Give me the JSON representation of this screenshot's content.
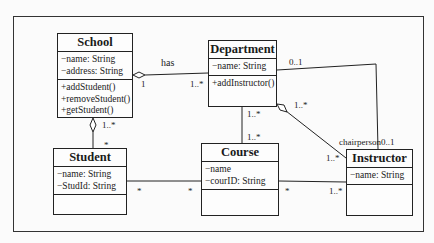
{
  "diagram": {
    "type": "UML class diagram",
    "classes": [
      {
        "name": "School",
        "attributes": [
          "−name: String",
          "−address: String"
        ],
        "operations": [
          "+addStudent()",
          "+removeStudent()",
          "+getStudent()"
        ]
      },
      {
        "name": "Department",
        "attributes": [
          "−name: String"
        ],
        "operations": [
          "+addInstructor()"
        ]
      },
      {
        "name": "Student",
        "attributes": [
          "−name: String",
          "−StudId: String"
        ],
        "operations": []
      },
      {
        "name": "Course",
        "attributes": [
          "−name",
          "−courID: String"
        ],
        "operations": []
      },
      {
        "name": "Instructor",
        "attributes": [
          "−name: String"
        ],
        "operations": []
      }
    ],
    "associations": [
      {
        "from": "School",
        "to": "Department",
        "label": "has",
        "from_mult": "1",
        "to_mult": "1..*",
        "kind": "aggregation"
      },
      {
        "from": "School",
        "to": "Student",
        "from_mult": "1..*",
        "to_mult": "*",
        "kind": "aggregation"
      },
      {
        "from": "Department",
        "to": "Course",
        "from_mult": "1..*",
        "to_mult": "1..*",
        "kind": "association"
      },
      {
        "from": "Department",
        "to": "Instructor",
        "from_mult": "1..*",
        "to_mult": "1..*",
        "kind": "aggregation"
      },
      {
        "from": "Department",
        "to": "Instructor",
        "from_mult": "0..1",
        "to_mult": "chairperson0..1",
        "kind": "association"
      },
      {
        "from": "Student",
        "to": "Course",
        "from_mult": "*",
        "to_mult": "*",
        "kind": "association"
      },
      {
        "from": "Course",
        "to": "Instructor",
        "from_mult": "*",
        "to_mult": "1..*",
        "kind": "association"
      }
    ]
  },
  "labels": {
    "has": "has",
    "school_dept_1": "1",
    "school_dept_many": "1..*",
    "school_student_many": "1..*",
    "student_star": "*",
    "dept_zero_one": "0..1",
    "dept_agg_instr": "1..*",
    "dept_course_top": "1..*",
    "dept_course_bottom": "1..*",
    "instr_agg_end": "1..*",
    "chairperson": "chairperson0..1",
    "student_course_left": "*",
    "student_course_right": "*",
    "course_instr_left": "*",
    "course_instr_right": "1..*"
  }
}
